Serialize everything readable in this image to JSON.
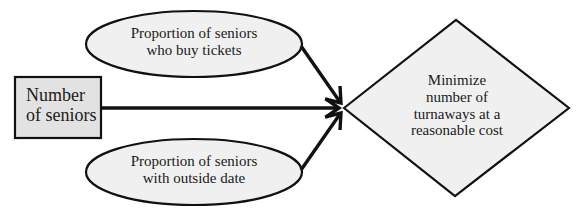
{
  "diagram": {
    "type": "influence-diagram",
    "colors": {
      "node_fill": "#f0f0f0",
      "rect_fill": "#e2e2e2",
      "stroke": "#111111",
      "text": "#1a1a1a"
    },
    "nodes": {
      "decision": {
        "shape": "rectangle",
        "line1": "Number",
        "line2": "of seniors"
      },
      "uncertain_top": {
        "shape": "ellipse",
        "line1": "Proportion of seniors",
        "line2": "who buy tickets"
      },
      "uncertain_bottom": {
        "shape": "ellipse",
        "line1": "Proportion of seniors",
        "line2": "with outside date"
      },
      "objective": {
        "shape": "diamond",
        "line1": "Minimize",
        "line2": "number of",
        "line3": "turnaways at a",
        "line4": "reasonable cost"
      }
    },
    "edges": [
      {
        "from": "uncertain_top",
        "to": "objective"
      },
      {
        "from": "decision",
        "to": "objective"
      },
      {
        "from": "uncertain_bottom",
        "to": "objective"
      }
    ]
  }
}
